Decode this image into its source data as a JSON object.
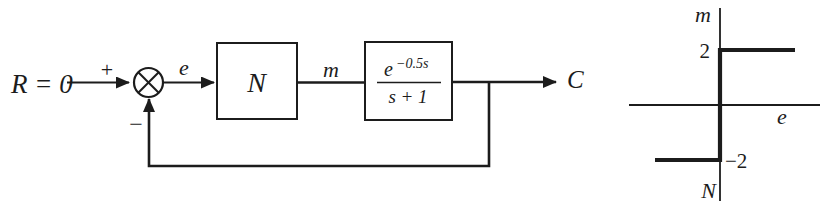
{
  "figure": {
    "background_color": "#ffffff",
    "line_color": "#1c1c1c"
  },
  "block_diagram": {
    "input_label": "R = 0",
    "sum_plus_sign": "+",
    "sum_minus_sign": "−",
    "error_signal_label": "e",
    "nonlinearity_block_label": "N",
    "control_signal_label": "m",
    "plant_numerator_base": "e",
    "plant_numerator_exponent": "−0.5s",
    "plant_denominator": "s + 1",
    "output_label": "C"
  },
  "relay_graph": {
    "y_axis_label": "m",
    "x_axis_label": "e",
    "upper_level_label": "2",
    "lower_level_label": "−2",
    "nonlinearity_label": "N",
    "upper_level_value": 2,
    "lower_level_value": -2,
    "characteristic": "ideal relay: output m = +2 for e > 0, m = −2 for e < 0"
  }
}
